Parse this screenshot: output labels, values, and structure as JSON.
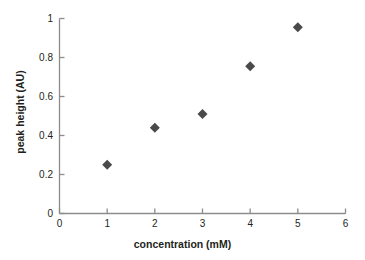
{
  "chart_data": {
    "type": "scatter",
    "title": "",
    "xlabel": "concentration (mM)",
    "ylabel": "peak height (AU)",
    "xlim": [
      0,
      6
    ],
    "ylim": [
      0,
      1
    ],
    "xticks": [
      "0",
      "1",
      "2",
      "3",
      "4",
      "5",
      "6"
    ],
    "yticks": [
      "0",
      "0.2",
      "0.4",
      "0.6",
      "0.8",
      "1"
    ],
    "grid": false,
    "legend": null,
    "marker": "diamond",
    "marker_color": "#4a4a4a",
    "axis_color": "#8c8c8c",
    "x": [
      1,
      2,
      3,
      4,
      5
    ],
    "y": [
      0.25,
      0.44,
      0.51,
      0.755,
      0.955
    ],
    "points": [
      {
        "x": 1,
        "y": 0.25
      },
      {
        "x": 2,
        "y": 0.44
      },
      {
        "x": 3,
        "y": 0.51
      },
      {
        "x": 4,
        "y": 0.755
      },
      {
        "x": 5,
        "y": 0.955
      }
    ]
  }
}
